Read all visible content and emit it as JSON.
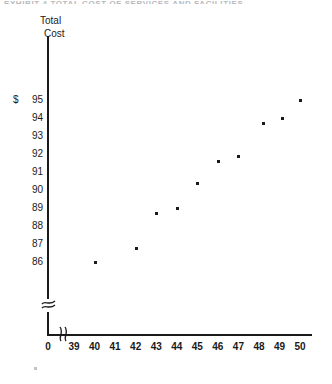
{
  "figure": {
    "top_clipped_text": "EXHIBIT 4  TOTAL COST OF SERVICES AND FACILITIES",
    "y_axis_title_line1": "Total",
    "y_axis_title_line2": "Cost",
    "x_axis_title": "Annual number of patient days",
    "currency_symbol": "$",
    "y_origin_label": "",
    "x_origin_label": "0"
  },
  "chart_data": {
    "type": "scatter",
    "title": "",
    "xlabel": "Annual number of patient days",
    "ylabel": "Total Cost",
    "currency": "$",
    "xlim": [
      39,
      50
    ],
    "ylim": [
      86,
      95
    ],
    "x_ticks": [
      "0",
      "39",
      "40",
      "41",
      "42",
      "43",
      "44",
      "45",
      "46",
      "47",
      "48",
      "49",
      "50"
    ],
    "y_ticks": [
      "95",
      "94",
      "93",
      "92",
      "91",
      "90",
      "89",
      "88",
      "87",
      "86"
    ],
    "x_axis_break": true,
    "y_axis_break": true,
    "grid": false,
    "legend": null,
    "marker": "square",
    "points": [
      {
        "x": 40.0,
        "y": 86.0
      },
      {
        "x": 42.0,
        "y": 86.8
      },
      {
        "x": 43.0,
        "y": 88.7
      },
      {
        "x": 44.0,
        "y": 89.0
      },
      {
        "x": 45.0,
        "y": 90.4
      },
      {
        "x": 46.0,
        "y": 91.6
      },
      {
        "x": 47.0,
        "y": 91.9
      },
      {
        "x": 48.2,
        "y": 93.7
      },
      {
        "x": 49.1,
        "y": 94.0
      },
      {
        "x": 50.0,
        "y": 95.0
      }
    ]
  },
  "colors": {
    "ink": "#1a1a1a",
    "background": "#ffffff"
  }
}
